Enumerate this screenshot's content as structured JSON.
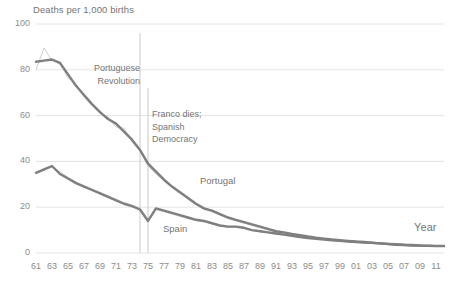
{
  "chart_data": {
    "type": "line",
    "title": "",
    "ylabel": "Deaths per 1,000 births",
    "xlabel": "Year",
    "ylim": [
      0,
      100
    ],
    "yticks": [
      "0",
      "20",
      "40",
      "60",
      "80",
      "100"
    ],
    "ytick_values": [
      0,
      20,
      40,
      60,
      80,
      100
    ],
    "grid": "horizontal",
    "legend": "inline-labels",
    "x": [
      1961,
      1962,
      1963,
      1964,
      1965,
      1966,
      1967,
      1968,
      1969,
      1970,
      1971,
      1972,
      1973,
      1974,
      1975,
      1976,
      1977,
      1978,
      1979,
      1980,
      1981,
      1982,
      1983,
      1984,
      1985,
      1986,
      1987,
      1988,
      1989,
      1990,
      1991,
      1992,
      1993,
      1994,
      1995,
      1996,
      1997,
      1998,
      1999,
      2000,
      2001,
      2002,
      2003,
      2004,
      2005,
      2006,
      2007,
      2008,
      2009,
      2010,
      2011,
      2012
    ],
    "xticks": [
      "61",
      "63",
      "65",
      "67",
      "69",
      "71",
      "73",
      "75",
      "77",
      "79",
      "81",
      "83",
      "85",
      "87",
      "89",
      "91",
      "93",
      "95",
      "97",
      "99",
      "01",
      "03",
      "05",
      "07",
      "09",
      "11"
    ],
    "xtick_values": [
      1961,
      1963,
      1965,
      1967,
      1969,
      1971,
      1973,
      1975,
      1977,
      1979,
      1981,
      1983,
      1985,
      1987,
      1989,
      1991,
      1993,
      1995,
      1997,
      1999,
      2001,
      2003,
      2005,
      2007,
      2009,
      2011
    ],
    "series": [
      {
        "name": "Portugal",
        "color": "#7f7f7f",
        "style": "smoothed-thick",
        "values": [
          83.5,
          84.0,
          84.5,
          83.0,
          78.0,
          73.0,
          69.0,
          65.0,
          61.5,
          58.5,
          56.5,
          53.0,
          49.5,
          45.0,
          39.0,
          35.5,
          32.0,
          29.0,
          26.5,
          24.0,
          21.5,
          19.5,
          18.5,
          17.0,
          15.5,
          14.5,
          13.5,
          12.5,
          11.5,
          10.5,
          9.5,
          9.0,
          8.3,
          7.8,
          7.2,
          6.7,
          6.3,
          5.9,
          5.6,
          5.3,
          5.0,
          4.8,
          4.5,
          4.2,
          3.9,
          3.6,
          3.5,
          3.3,
          3.2,
          3.1,
          3.0,
          3.0
        ]
      },
      {
        "name": "Portugal raw",
        "color": "#d0d0d0",
        "style": "raw-thin",
        "values": [
          80.0,
          89.5,
          84.0,
          82.5,
          76.5,
          74.0,
          68.0,
          64.5,
          61.0,
          59.5,
          55.0,
          54.5,
          48.5,
          44.5,
          38.0,
          34.5,
          31.5,
          28.5,
          26.0,
          23.5,
          21.0,
          19.0,
          18.0,
          16.5,
          15.0,
          14.0,
          13.0,
          12.0,
          11.0,
          10.0,
          9.2,
          8.7,
          8.0,
          7.5,
          7.0,
          6.5,
          6.1,
          5.7,
          5.4,
          5.1,
          4.8,
          4.6,
          4.3,
          4.0,
          3.7,
          3.5,
          3.4,
          3.2,
          3.1,
          3.0,
          2.9,
          2.9
        ]
      },
      {
        "name": "Spain",
        "color": "#7f7f7f",
        "style": "smoothed-thick",
        "values": [
          35.0,
          36.5,
          38.0,
          34.5,
          32.5,
          30.5,
          29.0,
          27.5,
          26.0,
          24.5,
          23.0,
          21.5,
          20.5,
          19.0,
          14.0,
          19.5,
          18.5,
          17.5,
          16.5,
          15.5,
          14.5,
          14.0,
          13.0,
          12.0,
          11.5,
          11.5,
          11.0,
          10.0,
          9.5,
          9.0,
          8.5,
          8.0,
          7.5,
          7.0,
          6.5,
          6.2,
          5.9,
          5.6,
          5.3,
          5.0,
          4.8,
          4.6,
          4.4,
          4.2,
          4.0,
          3.8,
          3.6,
          3.5,
          3.3,
          3.2,
          3.1,
          3.1
        ]
      },
      {
        "name": "Spain raw",
        "color": "#d0d0d0",
        "style": "raw-thin",
        "values": [
          35.0,
          36.0,
          37.5,
          35.5,
          33.0,
          31.0,
          29.5,
          28.0,
          26.5,
          25.0,
          23.5,
          22.0,
          21.0,
          19.5,
          14.5,
          19.0,
          18.0,
          17.0,
          16.0,
          15.0,
          14.2,
          13.6,
          12.6,
          11.8,
          11.2,
          11.2,
          10.7,
          9.8,
          9.3,
          8.8,
          8.3,
          7.8,
          7.3,
          6.9,
          6.4,
          6.1,
          5.8,
          5.5,
          5.2,
          4.9,
          4.7,
          4.5,
          4.3,
          4.1,
          3.9,
          3.7,
          3.6,
          3.4,
          3.3,
          3.2,
          3.1,
          3.1
        ]
      }
    ],
    "annotations": [
      {
        "id": "portuguese-revolution",
        "lines": [
          "Portuguese",
          "Revolution"
        ],
        "marker_x": 1974,
        "marker_top_value": 96,
        "marker_bottom_value": 0
      },
      {
        "id": "franco-dies",
        "lines": [
          "Franco dies;",
          "Spanish",
          "Democracy"
        ],
        "marker_x": 1975,
        "marker_top_value": 72,
        "marker_bottom_value": 0
      }
    ]
  },
  "colors": {
    "series_dark": "#7f7f7f",
    "series_light": "#d0d0d0",
    "gridline": "#e4e4e4",
    "text": "#757575",
    "tick_text": "#8c8c8c",
    "annotation_line": "#c9c9c9"
  },
  "labels": {
    "y_axis_title": "Deaths per 1,000 births",
    "x_axis_title": "Year",
    "portugal": "Portugal",
    "spain": "Spain",
    "annotation_pt_1": "Portuguese",
    "annotation_pt_2": "Revolution",
    "annotation_es_1": "Franco dies;",
    "annotation_es_2": "Spanish",
    "annotation_es_3": "Democracy"
  },
  "y_ticks": [
    {
      "label": "100"
    },
    {
      "label": "80"
    },
    {
      "label": "60"
    },
    {
      "label": "40"
    },
    {
      "label": "20"
    },
    {
      "label": "0"
    }
  ],
  "x_ticks": [
    {
      "label": "61"
    },
    {
      "label": "63"
    },
    {
      "label": "65"
    },
    {
      "label": "67"
    },
    {
      "label": "69"
    },
    {
      "label": "71"
    },
    {
      "label": "73"
    },
    {
      "label": "75"
    },
    {
      "label": "77"
    },
    {
      "label": "79"
    },
    {
      "label": "81"
    },
    {
      "label": "83"
    },
    {
      "label": "85"
    },
    {
      "label": "87"
    },
    {
      "label": "89"
    },
    {
      "label": "91"
    },
    {
      "label": "93"
    },
    {
      "label": "95"
    },
    {
      "label": "97"
    },
    {
      "label": "99"
    },
    {
      "label": "01"
    },
    {
      "label": "03"
    },
    {
      "label": "05"
    },
    {
      "label": "07"
    },
    {
      "label": "09"
    },
    {
      "label": "11"
    }
  ]
}
